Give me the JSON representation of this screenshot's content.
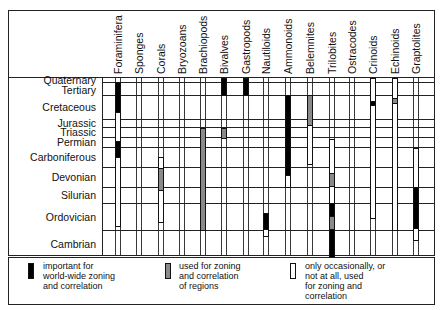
{
  "chart_data": {
    "type": "table",
    "title": "",
    "colors": {
      "important": "#000000",
      "regional": "#8a8a8a",
      "occasional": "#ffffff",
      "line": "#222222"
    },
    "periods": [
      "Quaternary",
      "Tertiary",
      "Cretaceous",
      "Jurassic",
      "Triassic",
      "Permian",
      "Carboniferous",
      "Devonian",
      "Silurian",
      "Ordovician",
      "Cambrian"
    ],
    "groups": [
      "Foraminifera",
      "Sponges",
      "Corals",
      "Bryozoans",
      "Brachiopods",
      "Bivalves",
      "Gastropods",
      "Nautiloids",
      "Ammonoids",
      "Belemnites",
      "Trilobites",
      "Ostracodes",
      "Crinoids",
      "Echinoids",
      "Graptolites"
    ],
    "bars": [
      {
        "group": "Foraminifera",
        "segments": [
          {
            "from": 82,
            "to": 112,
            "type": "important"
          },
          {
            "from": 112,
            "to": 141,
            "type": "occasional"
          },
          {
            "from": 141,
            "to": 157,
            "type": "important"
          },
          {
            "from": 157,
            "to": 226,
            "type": "occasional"
          }
        ]
      },
      {
        "group": "Corals",
        "segments": [
          {
            "from": 157,
            "to": 168,
            "type": "occasional"
          },
          {
            "from": 168,
            "to": 190,
            "type": "regional"
          },
          {
            "from": 190,
            "to": 222,
            "type": "occasional"
          }
        ]
      },
      {
        "group": "Brachiopods",
        "segments": [
          {
            "from": 128,
            "to": 230,
            "type": "regional"
          }
        ]
      },
      {
        "group": "Bivalves",
        "segments": [
          {
            "from": 78,
            "to": 95,
            "type": "important"
          },
          {
            "from": 128,
            "to": 138,
            "type": "regional"
          }
        ]
      },
      {
        "group": "Gastropods",
        "segments": [
          {
            "from": 78,
            "to": 95,
            "type": "important"
          }
        ]
      },
      {
        "group": "Nautiloids",
        "segments": [
          {
            "from": 213,
            "to": 229,
            "type": "important"
          },
          {
            "from": 229,
            "to": 236,
            "type": "occasional"
          }
        ]
      },
      {
        "group": "Ammonoids",
        "segments": [
          {
            "from": 95,
            "to": 175,
            "type": "important"
          },
          {
            "from": 175,
            "to": 187,
            "type": "occasional"
          }
        ]
      },
      {
        "group": "Belemnites",
        "segments": [
          {
            "from": 95,
            "to": 125,
            "type": "regional"
          },
          {
            "from": 125,
            "to": 164,
            "type": "occasional"
          }
        ]
      },
      {
        "group": "Trilobites",
        "segments": [
          {
            "from": 139,
            "to": 173,
            "type": "occasional"
          },
          {
            "from": 173,
            "to": 186,
            "type": "regional"
          },
          {
            "from": 186,
            "to": 203,
            "type": "occasional"
          },
          {
            "from": 203,
            "to": 216,
            "type": "important"
          },
          {
            "from": 216,
            "to": 229,
            "type": "regional"
          },
          {
            "from": 229,
            "to": 257,
            "type": "important"
          }
        ]
      },
      {
        "group": "Crinoids",
        "segments": [
          {
            "from": 78,
            "to": 101,
            "type": "occasional"
          },
          {
            "from": 101,
            "to": 105,
            "type": "important"
          },
          {
            "from": 105,
            "to": 218,
            "type": "occasional"
          }
        ]
      },
      {
        "group": "Echinoids",
        "segments": [
          {
            "from": 78,
            "to": 98,
            "type": "occasional"
          },
          {
            "from": 98,
            "to": 103,
            "type": "regional"
          },
          {
            "from": 103,
            "to": 230,
            "type": "occasional"
          }
        ]
      },
      {
        "group": "Graptolites",
        "segments": [
          {
            "from": 148,
            "to": 187,
            "type": "occasional"
          },
          {
            "from": 187,
            "to": 228,
            "type": "important"
          },
          {
            "from": 228,
            "to": 240,
            "type": "occasional"
          }
        ]
      }
    ],
    "legend": [
      {
        "type": "important",
        "lines": [
          "important for",
          "world-wide zoning",
          "and correlation"
        ]
      },
      {
        "type": "regional",
        "lines": [
          "used for zoning",
          "and correlation",
          "of regions"
        ]
      },
      {
        "type": "occasional",
        "lines": [
          "only occasionally, or",
          "not at all, used",
          "for zoning and",
          "correlation"
        ]
      }
    ]
  }
}
